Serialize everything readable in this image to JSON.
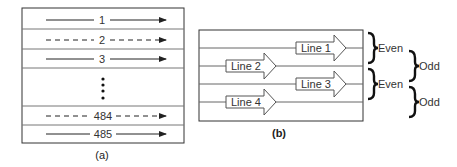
{
  "panel_a": {
    "caption": "(a)",
    "rows": [
      {
        "label": "1",
        "style": "solid"
      },
      {
        "label": "2",
        "style": "dashed"
      },
      {
        "label": "3",
        "style": "solid"
      },
      {
        "label": "484",
        "style": "dashed"
      },
      {
        "label": "485",
        "style": "solid"
      }
    ],
    "ellipsis": "vertical-dots"
  },
  "panel_b": {
    "caption": "(b)",
    "arrows": [
      {
        "label": "Line 1"
      },
      {
        "label": "Line 2"
      },
      {
        "label": "Line 3"
      },
      {
        "label": "Line 4"
      }
    ],
    "braces": [
      {
        "label": "Even"
      },
      {
        "label": "Odd"
      },
      {
        "label": "Even"
      },
      {
        "label": "Odd"
      }
    ]
  }
}
